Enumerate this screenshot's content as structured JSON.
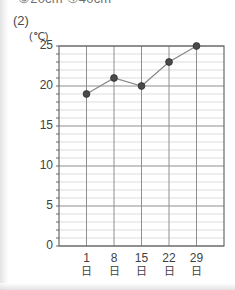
{
  "header": {
    "cropped_text": "③20cm  ④40cm"
  },
  "question": {
    "number": "(2)"
  },
  "chart_data": {
    "type": "line",
    "title": "",
    "subtitle": "",
    "xlabel": "",
    "ylabel": "",
    "unit_caption": "(℃)",
    "categories": [
      "1日",
      "8日",
      "15日",
      "22日",
      "29日"
    ],
    "x_tick_numbers": [
      "1",
      "8",
      "15",
      "22",
      "29"
    ],
    "x_tick_units": [
      "日",
      "日",
      "日",
      "日",
      "日"
    ],
    "values": [
      19,
      21,
      20,
      23,
      25
    ],
    "ylim": [
      0,
      25
    ],
    "ytick_labels": [
      "0",
      "5",
      "10",
      "15",
      "20",
      "25"
    ],
    "ytick_values": [
      0,
      5,
      10,
      15,
      20,
      25
    ],
    "minor_tick_step": 1,
    "grid": true,
    "legend": "none",
    "series": [
      {
        "name": "気温",
        "values": [
          19,
          21,
          20,
          23,
          25
        ]
      }
    ],
    "colors": {
      "line": "#8a8a8a",
      "marker": "#4a4a4a",
      "major_grid": "#8f8f8f",
      "minor_grid": "#cdcdcd",
      "axis": "#6a6a6a"
    }
  }
}
